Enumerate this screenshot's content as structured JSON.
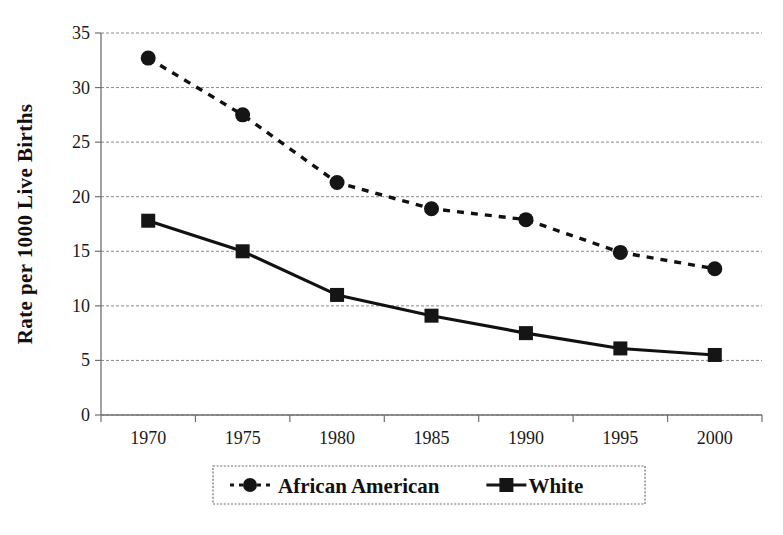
{
  "chart_data": {
    "type": "line",
    "title": "",
    "xlabel": "",
    "ylabel": "Rate per 1000 Live Births",
    "categories": [
      "1970",
      "1975",
      "1980",
      "1985",
      "1990",
      "1995",
      "2000"
    ],
    "x": [
      1970,
      1975,
      1980,
      1985,
      1990,
      1995,
      2000
    ],
    "xlim": [
      1970,
      2000
    ],
    "ylim": [
      0,
      35
    ],
    "y_ticks": [
      "0",
      "5",
      "10",
      "15",
      "20",
      "25",
      "30",
      "35"
    ],
    "y_tick_values": [
      0,
      5,
      10,
      15,
      20,
      25,
      30,
      35
    ],
    "grid": true,
    "legend_position": "bottom",
    "series": [
      {
        "name": "African American",
        "values": [
          32.7,
          27.5,
          21.3,
          18.9,
          17.9,
          14.9,
          13.4
        ],
        "line_style": "dashed",
        "marker": "circle",
        "color": "#151515"
      },
      {
        "name": "White",
        "values": [
          17.8,
          15.0,
          11.0,
          9.1,
          7.5,
          6.1,
          5.5
        ],
        "line_style": "solid",
        "marker": "square",
        "color": "#151515"
      }
    ]
  },
  "legend": {
    "items": [
      {
        "label": "African American",
        "marker": "circle",
        "line_style": "dashed"
      },
      {
        "label": "White",
        "marker": "square",
        "line_style": "solid"
      }
    ]
  },
  "axes": {
    "y_title": "Rate per 1000 Live Births",
    "y_labels": [
      "35",
      "30",
      "25",
      "20",
      "15",
      "10",
      "5",
      "0"
    ],
    "x_labels": [
      "1970",
      "1975",
      "1980",
      "1985",
      "1990",
      "1995",
      "2000"
    ]
  }
}
